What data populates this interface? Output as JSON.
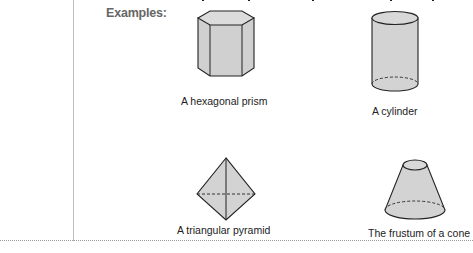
{
  "section": {
    "heading": "Examples:"
  },
  "figures": [
    {
      "id": "hexagonal-prism",
      "caption": "A hexagonal prism"
    },
    {
      "id": "cylinder",
      "caption": "A cylinder"
    },
    {
      "id": "triangular-pyramid",
      "caption": "A triangular pyramid"
    },
    {
      "id": "frustum",
      "caption": "The frustum of a cone"
    }
  ],
  "colors": {
    "fill": "#d3d3d3",
    "stroke": "#222222",
    "heading": "#666666"
  }
}
